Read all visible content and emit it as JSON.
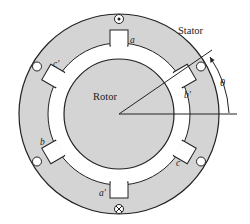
{
  "diagram": {
    "labels": {
      "stator": "Stator",
      "rotor": "Rotor",
      "theta": "θ"
    },
    "slots": [
      {
        "id": "a",
        "label": "a",
        "angle_deg": 90,
        "conductor": "dot"
      },
      {
        "id": "b_prime",
        "label": "b′",
        "angle_deg": 30,
        "conductor": "empty"
      },
      {
        "id": "c",
        "label": "c",
        "angle_deg": -30,
        "conductor": "empty"
      },
      {
        "id": "a_prime",
        "label": "a′",
        "angle_deg": -90,
        "conductor": "cross"
      },
      {
        "id": "b",
        "label": "b",
        "angle_deg": 210,
        "conductor": "empty"
      },
      {
        "id": "c_prime",
        "label": "c′",
        "angle_deg": 150,
        "conductor": "empty"
      }
    ],
    "colors": {
      "stator_fill": "#d4d4d4",
      "rotor_fill": "#d4d4d4",
      "air_gap": "#ffffff",
      "line": "#222222"
    }
  }
}
